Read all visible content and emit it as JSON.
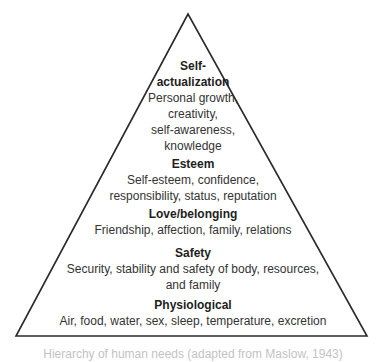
{
  "diagram": {
    "type": "pyramid",
    "stroke_color": "#2a2a2a",
    "levels": [
      {
        "title_line1": "Self-",
        "title_line2": "actualization",
        "desc_lines": [
          "Personal growth,",
          "creativity,",
          "self-awareness,",
          "knowledge"
        ]
      },
      {
        "title": "Esteem",
        "desc_lines": [
          "Self-esteem, confidence,",
          "responsibility, status, reputation"
        ]
      },
      {
        "title": "Love/belonging",
        "desc_lines": [
          "Friendship, affection, family, relations"
        ]
      },
      {
        "title": "Safety",
        "desc_lines": [
          "Security, stability and safety of body, resources,",
          "and family"
        ]
      },
      {
        "title": "Physiological",
        "desc_lines": [
          "Air, food, water, sex, sleep, temperature, excretion"
        ]
      }
    ],
    "caption": "Hierarchy of human needs (adapted from Maslow, 1943)"
  }
}
